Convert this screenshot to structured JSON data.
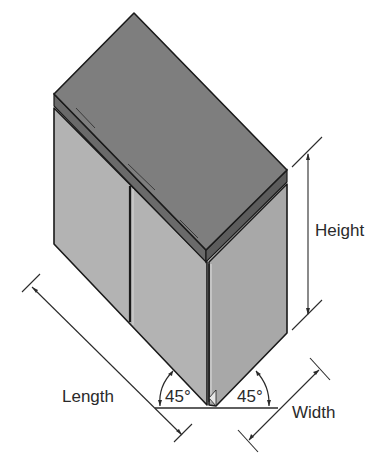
{
  "diagram": {
    "labels": {
      "height": "Height",
      "length": "Length",
      "width": "Width",
      "angle_left": "45°",
      "angle_right": "45°"
    },
    "colors": {
      "top_surface": "#7e7e7e",
      "top_edge": "#5c5c5c",
      "left_face": "#b3b3b3",
      "right_face": "#a8a8a8",
      "outline": "#1a1a1a",
      "dimension_line": "#2a2a2a",
      "background": "#ffffff"
    }
  }
}
